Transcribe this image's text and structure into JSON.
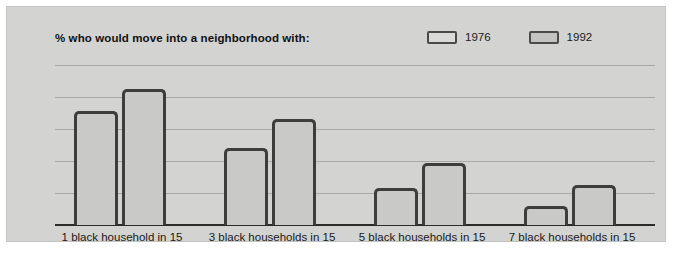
{
  "chart_data": {
    "type": "bar",
    "title": "% who would move into a neighborhood with:",
    "xlabel": "",
    "ylabel": "",
    "ylim": [
      0,
      100
    ],
    "yticks": [
      0,
      20,
      40,
      60,
      80,
      100
    ],
    "grid": true,
    "legend_position": "top-right",
    "categories": [
      "1 black household in 15",
      "3 black households in 15",
      "5 black households in 15",
      "7 black households in 15"
    ],
    "series": [
      {
        "name": "1976",
        "color": "#dadad8",
        "values": [
          71,
          48,
          23,
          12
        ]
      },
      {
        "name": "1992",
        "color": "#c3c3c1",
        "values": [
          85,
          66,
          39,
          25
        ]
      }
    ]
  },
  "style": {
    "panel_background": "#d3d3d1",
    "bar_fill": "#c9c9c7",
    "bar_border": "#3d3d3d",
    "gridline_color": "#a8a8a6",
    "axis_color": "#2b2b2b",
    "text_color": "#1a1a1a"
  }
}
